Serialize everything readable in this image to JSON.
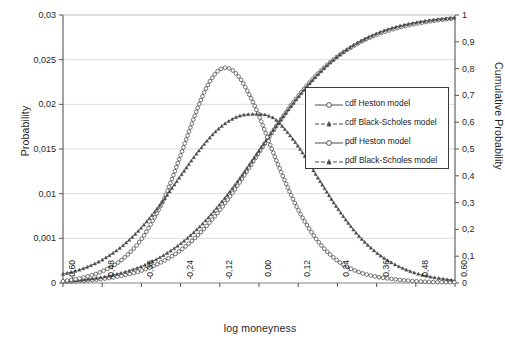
{
  "chart_data": {
    "type": "line",
    "title": "",
    "xlabel": "log moneyness",
    "ylabel": "Probability",
    "ylabel_right": "Cumulative Probability",
    "xlim": [
      -0.6,
      0.6
    ],
    "ylim_left": [
      0,
      0.03
    ],
    "ylim_right": [
      0,
      1
    ],
    "grid": true,
    "legend_position": "center-right",
    "x_ticks": [
      "-0,60",
      "-0,48",
      "-0,36",
      "-0,24",
      "-0,12",
      "0,00",
      "0,12",
      "0,24",
      "0,36",
      "0,48",
      "0,60"
    ],
    "x_tick_values": [
      -0.6,
      -0.48,
      -0.36,
      -0.24,
      -0.12,
      0.0,
      0.12,
      0.24,
      0.36,
      0.48,
      0.6
    ],
    "y_ticks_left": [
      "0",
      "0,001",
      "0,01",
      "0,015",
      "0,02",
      "0,025",
      "0,03"
    ],
    "y_tick_values_left": [
      0,
      0.005,
      0.01,
      0.015,
      0.02,
      0.025,
      0.03
    ],
    "y_ticks_right": [
      "0",
      "0,1",
      "0,2",
      "0,3",
      "0,4",
      "0,5",
      "0,6",
      "0,7",
      "0,8",
      "0,9",
      "1"
    ],
    "y_tick_values_right": [
      0,
      0.1,
      0.2,
      0.3,
      0.4,
      0.5,
      0.6,
      0.7,
      0.8,
      0.9,
      1.0
    ],
    "legend": [
      "cdf Heston model",
      "cdf Black-Scholes model",
      "pdf Heston model",
      "pdf Black-Scholes model"
    ],
    "series": [
      {
        "name": "cdf Heston model",
        "axis": "right",
        "marker": "circle",
        "linestyle": "solid",
        "color": "#4a4a4a",
        "x": [
          -0.6,
          -0.54,
          -0.48,
          -0.42,
          -0.36,
          -0.3,
          -0.24,
          -0.18,
          -0.12,
          -0.06,
          0.0,
          0.06,
          0.12,
          0.18,
          0.24,
          0.3,
          0.36,
          0.42,
          0.48,
          0.54,
          0.6
        ],
        "y": [
          0.004,
          0.008,
          0.015,
          0.027,
          0.046,
          0.077,
          0.122,
          0.187,
          0.272,
          0.374,
          0.487,
          0.598,
          0.698,
          0.781,
          0.845,
          0.892,
          0.926,
          0.95,
          0.967,
          0.979,
          0.988
        ]
      },
      {
        "name": "cdf Black-Scholes model",
        "axis": "right",
        "marker": "triangle",
        "linestyle": "dashed",
        "color": "#4a4a4a",
        "x": [
          -0.6,
          -0.54,
          -0.48,
          -0.42,
          -0.36,
          -0.3,
          -0.24,
          -0.18,
          -0.12,
          -0.06,
          0.0,
          0.06,
          0.12,
          0.18,
          0.24,
          0.3,
          0.36,
          0.42,
          0.48,
          0.54,
          0.6
        ],
        "y": [
          0.006,
          0.012,
          0.022,
          0.038,
          0.062,
          0.098,
          0.147,
          0.212,
          0.294,
          0.389,
          0.494,
          0.598,
          0.694,
          0.778,
          0.845,
          0.895,
          0.931,
          0.956,
          0.972,
          0.983,
          0.99
        ]
      },
      {
        "name": "pdf Heston model",
        "axis": "left",
        "marker": "circle",
        "linestyle": "solid",
        "color": "#4a4a4a",
        "x": [
          -0.6,
          -0.54,
          -0.48,
          -0.42,
          -0.36,
          -0.3,
          -0.27,
          -0.24,
          -0.21,
          -0.18,
          -0.15,
          -0.12,
          -0.09,
          -0.06,
          -0.03,
          0.0,
          0.06,
          0.12,
          0.18,
          0.24,
          0.3,
          0.36,
          0.42,
          0.48,
          0.54,
          0.6
        ],
        "y": [
          0.0002,
          0.0006,
          0.0013,
          0.0026,
          0.0049,
          0.0087,
          0.0113,
          0.0143,
          0.0174,
          0.0203,
          0.0226,
          0.0239,
          0.024,
          0.023,
          0.0211,
          0.0187,
          0.0131,
          0.0082,
          0.0047,
          0.0025,
          0.0013,
          0.0007,
          0.0004,
          0.0002,
          0.0001,
          0.0001
        ]
      },
      {
        "name": "pdf Black-Scholes model",
        "axis": "left",
        "marker": "triangle",
        "linestyle": "dashed",
        "color": "#4a4a4a",
        "x": [
          -0.6,
          -0.54,
          -0.48,
          -0.42,
          -0.36,
          -0.3,
          -0.24,
          -0.18,
          -0.12,
          -0.06,
          0.0,
          0.03,
          0.06,
          0.12,
          0.18,
          0.24,
          0.3,
          0.36,
          0.42,
          0.48,
          0.54,
          0.6
        ],
        "y": [
          0.001,
          0.0016,
          0.0026,
          0.0041,
          0.0062,
          0.0089,
          0.012,
          0.015,
          0.0174,
          0.0187,
          0.0189,
          0.0187,
          0.018,
          0.0153,
          0.0118,
          0.0084,
          0.0055,
          0.0034,
          0.002,
          0.0011,
          0.0006,
          0.0003
        ]
      }
    ]
  }
}
